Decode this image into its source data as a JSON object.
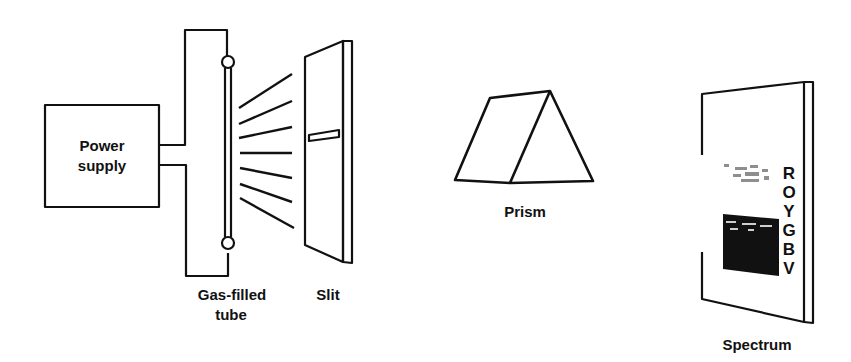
{
  "diagram": {
    "labels": {
      "power_supply_line1": "Power",
      "power_supply_line2": "supply",
      "tube_line1": "Gas-filled",
      "tube_line2": "tube",
      "slit": "Slit",
      "prism": "Prism",
      "spectrum": "Spectrum"
    },
    "spectrum_colors": [
      "R",
      "O",
      "Y",
      "G",
      "B",
      "V"
    ],
    "stroke_color": "#111111"
  }
}
